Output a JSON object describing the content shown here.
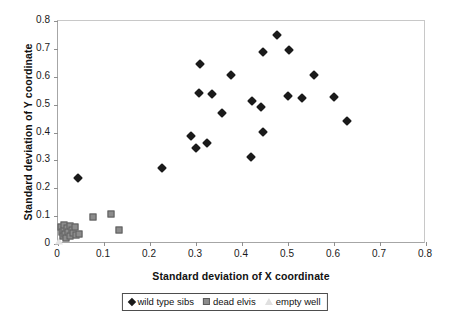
{
  "chart_data": {
    "type": "scatter",
    "title": "",
    "xlabel": "Standard deviation of X coordinate",
    "ylabel": "Standard deviation of Y coordinate",
    "xlim": [
      0,
      0.8
    ],
    "ylim": [
      0,
      0.8
    ],
    "xticks": [
      "0",
      "0.1",
      "0.2",
      "0.3",
      "0.4",
      "0.5",
      "0.6",
      "0.7",
      "0.8"
    ],
    "xtick_values": [
      0,
      0.1,
      0.2,
      0.3,
      0.4,
      0.5,
      0.6,
      0.7,
      0.8
    ],
    "yticks": [
      "0",
      "0.1",
      "0.2",
      "0.3",
      "0.4",
      "0.5",
      "0.6",
      "0.7",
      "0.8"
    ],
    "ytick_values": [
      0,
      0.1,
      0.2,
      0.3,
      0.4,
      0.5,
      0.6,
      0.7,
      0.8
    ],
    "grid": false,
    "legend_position": "bottom",
    "colors": {
      "wild_type_sibs": "#1a1a1a",
      "dead_elvis": "#8c8c8c",
      "empty_well": "#e4e4e4",
      "axis": "#a6a6a6",
      "background": "#ffffff"
    },
    "series": [
      {
        "name": "wild type sibs",
        "marker": "diamond",
        "color": "#1a1a1a",
        "points": [
          [
            0.043,
            0.236
          ],
          [
            0.227,
            0.271
          ],
          [
            0.29,
            0.387
          ],
          [
            0.299,
            0.345
          ],
          [
            0.306,
            0.541
          ],
          [
            0.309,
            0.646
          ],
          [
            0.323,
            0.363
          ],
          [
            0.334,
            0.537
          ],
          [
            0.357,
            0.471
          ],
          [
            0.376,
            0.606
          ],
          [
            0.42,
            0.311
          ],
          [
            0.422,
            0.513
          ],
          [
            0.442,
            0.49
          ],
          [
            0.445,
            0.402
          ],
          [
            0.446,
            0.689
          ],
          [
            0.476,
            0.749
          ],
          [
            0.5,
            0.53
          ],
          [
            0.503,
            0.695
          ],
          [
            0.53,
            0.524
          ],
          [
            0.556,
            0.605
          ],
          [
            0.6,
            0.527
          ],
          [
            0.628,
            0.443
          ]
        ]
      },
      {
        "name": "dead elvis",
        "marker": "square",
        "color": "#8c8c8c",
        "points": [
          [
            0.006,
            0.06
          ],
          [
            0.008,
            0.042
          ],
          [
            0.01,
            0.028
          ],
          [
            0.012,
            0.052
          ],
          [
            0.014,
            0.068
          ],
          [
            0.016,
            0.036
          ],
          [
            0.018,
            0.022
          ],
          [
            0.02,
            0.056
          ],
          [
            0.022,
            0.044
          ],
          [
            0.025,
            0.03
          ],
          [
            0.027,
            0.064
          ],
          [
            0.03,
            0.05
          ],
          [
            0.033,
            0.038
          ],
          [
            0.036,
            0.06
          ],
          [
            0.04,
            0.032
          ],
          [
            0.045,
            0.035
          ],
          [
            0.077,
            0.098
          ],
          [
            0.115,
            0.107
          ],
          [
            0.132,
            0.05
          ]
        ]
      },
      {
        "name": "empty well",
        "marker": "triangle",
        "color": "#e4e4e4",
        "points": [
          [
            0.003,
            0.01
          ]
        ]
      }
    ]
  },
  "legend": {
    "items": [
      {
        "label": "wild type sibs",
        "marker": "diamond"
      },
      {
        "label": "dead elvis",
        "marker": "square"
      },
      {
        "label": "empty well",
        "marker": "triangle"
      }
    ]
  }
}
